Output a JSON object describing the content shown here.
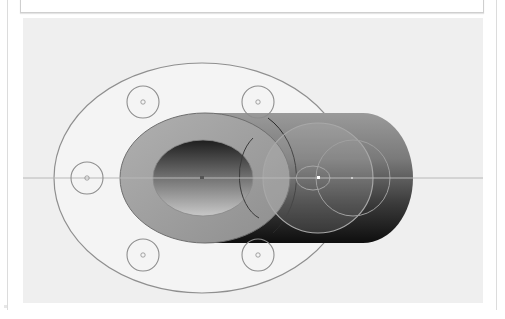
{
  "window": {
    "top_panel": {
      "label": ""
    }
  },
  "viewport": {
    "background": "#efefef",
    "model": {
      "name": "flanged-tube",
      "colors": {
        "outline": "#8a8a8a",
        "face_light": "#a8a8a8",
        "face_dark": "#2a2a2a",
        "centerline": "#b4b4b4",
        "flange_fill": "#f2f2f2"
      },
      "bolt_holes": [
        {
          "cx": 120,
          "cy": 84
        },
        {
          "cx": 235,
          "cy": 84
        },
        {
          "cx": 64,
          "cy": 160
        },
        {
          "cx": 120,
          "cy": 237
        },
        {
          "cx": 235,
          "cy": 237
        }
      ]
    }
  }
}
